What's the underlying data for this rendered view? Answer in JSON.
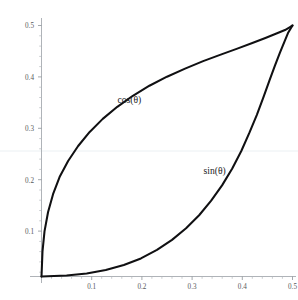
{
  "chart_data": {
    "type": "line",
    "title": "",
    "subtitle": "",
    "xlabel": "",
    "ylabel": "",
    "xlim": [
      0,
      0.52
    ],
    "ylim": [
      0,
      0.52
    ],
    "grid": "faint-horizontal-only",
    "legend_position": "inline-annotations",
    "background_color": "#ffffff",
    "curve_color": "#101012",
    "axis_color": "#9aa0a6",
    "gridline_color": "#e9eef2",
    "x_ticks": [
      {
        "value": 0.1,
        "label": "0.1"
      },
      {
        "value": 0.2,
        "label": "0.2"
      },
      {
        "value": 0.3,
        "label": "0.3"
      },
      {
        "value": 0.4,
        "label": "0.4"
      },
      {
        "value": 0.5,
        "label": "0.5"
      }
    ],
    "y_ticks": [
      {
        "value": 0.1,
        "label": "0.1"
      },
      {
        "value": 0.2,
        "label": "0.2"
      },
      {
        "value": 0.3,
        "label": "0.3"
      },
      {
        "value": 0.4,
        "label": "0.4"
      },
      {
        "value": 0.5,
        "label": "0.5"
      }
    ],
    "x_minor_tick_step": 0.02,
    "y_minor_tick_step": 0.02,
    "gridlines": [
      {
        "orientation": "horizontal",
        "value": 0.25
      }
    ],
    "annotations": [
      {
        "id": "cos-label",
        "text": "cos(θ)",
        "x": 0.175,
        "y": 0.345
      },
      {
        "id": "sin-label",
        "text": "sin(θ)",
        "x": 0.345,
        "y": 0.205
      }
    ],
    "series": [
      {
        "name": "cos(θ)",
        "label": "cos(θ)",
        "color": "#101012",
        "description": "upper boundary of lens, concave down, from (0,0) to (0.5,0.5)",
        "x": [
          0.0,
          0.002,
          0.006,
          0.013,
          0.023,
          0.036,
          0.053,
          0.073,
          0.096,
          0.122,
          0.151,
          0.182,
          0.215,
          0.25,
          0.286,
          0.322,
          0.357,
          0.39,
          0.42,
          0.446,
          0.468,
          0.485,
          0.495,
          0.5
        ],
        "y": [
          0.0,
          0.05,
          0.09,
          0.128,
          0.164,
          0.198,
          0.23,
          0.26,
          0.288,
          0.314,
          0.338,
          0.36,
          0.38,
          0.398,
          0.414,
          0.429,
          0.442,
          0.454,
          0.465,
          0.475,
          0.484,
          0.491,
          0.497,
          0.5
        ]
      },
      {
        "name": "sin(θ)",
        "label": "sin(θ)",
        "color": "#101012",
        "description": "lower boundary of lens, concave up, mirror of cos curve about the line y=x, from (0,0) to (0.5,0.5)",
        "x": [
          0.0,
          0.05,
          0.09,
          0.128,
          0.164,
          0.198,
          0.23,
          0.26,
          0.288,
          0.314,
          0.338,
          0.36,
          0.38,
          0.398,
          0.414,
          0.429,
          0.442,
          0.454,
          0.465,
          0.475,
          0.484,
          0.491,
          0.497,
          0.5
        ],
        "y": [
          0.0,
          0.002,
          0.006,
          0.013,
          0.023,
          0.036,
          0.053,
          0.073,
          0.096,
          0.122,
          0.151,
          0.182,
          0.215,
          0.25,
          0.286,
          0.322,
          0.357,
          0.39,
          0.42,
          0.446,
          0.468,
          0.485,
          0.495,
          0.5
        ]
      }
    ]
  }
}
